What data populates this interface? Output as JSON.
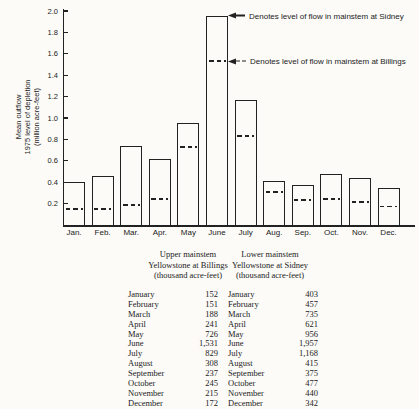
{
  "figure": {
    "background": "#fcfbf8",
    "ink": "#222222"
  },
  "chart_data": {
    "type": "bar",
    "title": "",
    "ylabel": "Mean outflow\n1975 level of depletion\n(million acre-feet)",
    "xlabel": "",
    "ylim": [
      0,
      2.0
    ],
    "yticks": [
      0.2,
      0.4,
      0.6,
      0.8,
      1.0,
      1.2,
      1.4,
      1.6,
      1.8,
      2.0
    ],
    "grid": false,
    "legend_position": "none",
    "categories": [
      "Jan.",
      "Feb.",
      "Mar.",
      "Apr.",
      "May",
      "June",
      "July",
      "Aug.",
      "Sep.",
      "Oct.",
      "Nov.",
      "Dec."
    ],
    "series": [
      {
        "name": "Level of flow in mainstem at Sidney (bar outline top)",
        "style": "outlined-bar",
        "values": [
          0.403,
          0.457,
          0.735,
          0.621,
          0.956,
          1.957,
          1.168,
          0.415,
          0.375,
          0.477,
          0.44,
          0.342
        ]
      },
      {
        "name": "Level of flow in mainstem at Billings (dashed level inside bar)",
        "style": "dashed-level",
        "values": [
          0.152,
          0.151,
          0.188,
          0.241,
          0.726,
          1.531,
          0.829,
          0.308,
          0.237,
          0.245,
          0.215,
          0.172
        ]
      }
    ],
    "annotations": [
      {
        "text": "Denotes level of flow in mainstem at Sidney",
        "points_to": "top of June bar",
        "arrow": "solid-left-arrow"
      },
      {
        "text": "Denotes level of flow in mainstem at Billings",
        "points_to": "dashed level in June bar",
        "arrow": "dashed-left-arrow"
      }
    ]
  },
  "table": {
    "columns": [
      {
        "header": "Upper mainstem\nYellowstone at Billings\n(thousand acre-feet)",
        "rows": [
          [
            "January",
            "152"
          ],
          [
            "February",
            "151"
          ],
          [
            "March",
            "188"
          ],
          [
            "April",
            "241"
          ],
          [
            "May",
            "726"
          ],
          [
            "June",
            "1,531"
          ],
          [
            "July",
            "829"
          ],
          [
            "August",
            "308"
          ],
          [
            "September",
            "237"
          ],
          [
            "October",
            "245"
          ],
          [
            "November",
            "215"
          ],
          [
            "December",
            "172"
          ]
        ]
      },
      {
        "header": "Lower mainstem\nYellowstone at Sidney\n(thousand acre-feet)",
        "rows": [
          [
            "January",
            "403"
          ],
          [
            "February",
            "457"
          ],
          [
            "March",
            "735"
          ],
          [
            "April",
            "621"
          ],
          [
            "May",
            "956"
          ],
          [
            "June",
            "1,957"
          ],
          [
            "July",
            "1,168"
          ],
          [
            "August",
            "415"
          ],
          [
            "September",
            "375"
          ],
          [
            "October",
            "477"
          ],
          [
            "November",
            "440"
          ],
          [
            "December",
            "342"
          ]
        ]
      }
    ]
  }
}
